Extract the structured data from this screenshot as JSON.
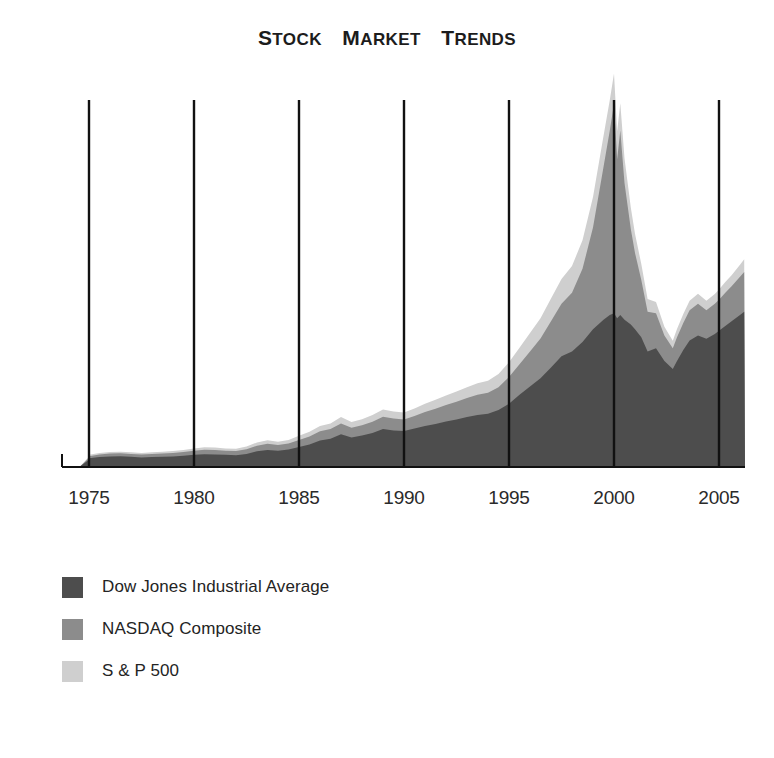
{
  "title": {
    "full": "STOCK MARKET TRENDS",
    "words": [
      {
        "cap": "S",
        "rest": "TOCK"
      },
      {
        "cap": "M",
        "rest": "ARKET"
      },
      {
        "cap": "T",
        "rest": "RENDS"
      }
    ]
  },
  "colors": {
    "dow": "#4d4d4d",
    "nasdaq": "#8c8c8c",
    "sp500": "#cfcfcf",
    "axis": "#111111",
    "text": "#1c1c1c",
    "background": "#ffffff"
  },
  "legend": {
    "position": "bottom-left",
    "items": [
      {
        "label": "Dow Jones Industrial Average",
        "color_key": "dow",
        "swatch_name": "dow-jones-swatch"
      },
      {
        "label": "NASDAQ Composite",
        "color_key": "nasdaq",
        "swatch_name": "nasdaq-swatch"
      },
      {
        "label": "S & P 500",
        "color_key": "sp500",
        "swatch_name": "sp500-swatch"
      }
    ]
  },
  "chart_data": {
    "type": "area",
    "stacked": true,
    "title": "Stock Market Trends",
    "xlabel": "",
    "ylabel": "",
    "grid": "vertical-only",
    "legend_position": "bottom-left",
    "xlim": [
      1974.0,
      2006.3
    ],
    "ylim": [
      0,
      100
    ],
    "axis_ticks": [
      "1975",
      "1980",
      "1985",
      "1990",
      "1995",
      "2000",
      "2005"
    ],
    "tick_values": [
      1975,
      1980,
      1985,
      1990,
      1995,
      2000,
      2005
    ],
    "note": "Values are relative index levels read off the plotted area heights (arbitrary units, 0-100 scale). Series are drawn stacked: Dow Jones at bottom, NASDAQ Composite above it, S & P 500 on top.",
    "x": [
      1974.6,
      1975.0,
      1975.5,
      1976.0,
      1976.5,
      1977.0,
      1977.5,
      1978.0,
      1978.5,
      1979.0,
      1979.5,
      1980.0,
      1980.5,
      1981.0,
      1981.5,
      1982.0,
      1982.5,
      1983.0,
      1983.5,
      1984.0,
      1984.5,
      1985.0,
      1985.5,
      1986.0,
      1986.5,
      1987.0,
      1987.5,
      1988.0,
      1988.5,
      1989.0,
      1989.5,
      1990.0,
      1990.5,
      1991.0,
      1991.5,
      1992.0,
      1992.5,
      1993.0,
      1993.5,
      1994.0,
      1994.5,
      1995.0,
      1995.5,
      1996.0,
      1996.5,
      1997.0,
      1997.5,
      1998.0,
      1998.5,
      1999.0,
      1999.5,
      1999.8,
      2000.0,
      2000.15,
      2000.3,
      2000.5,
      2000.8,
      2001.0,
      2001.3,
      2001.6,
      2002.0,
      2002.4,
      2002.8,
      2003.0,
      2003.3,
      2003.6,
      2004.0,
      2004.4,
      2004.8,
      2005.0,
      2005.3,
      2005.6,
      2006.0,
      2006.2
    ],
    "series": [
      {
        "name": "Dow Jones Industrial Average",
        "color": "#4d4d4d",
        "values": [
          2.0,
          2.4,
          2.8,
          3.0,
          3.1,
          2.9,
          2.7,
          2.8,
          2.9,
          3.0,
          3.2,
          3.5,
          3.7,
          3.6,
          3.5,
          3.4,
          3.8,
          4.6,
          5.0,
          4.8,
          5.2,
          6.0,
          6.8,
          8.0,
          8.6,
          10.0,
          9.0,
          9.6,
          10.4,
          11.6,
          11.2,
          11.0,
          11.8,
          12.6,
          13.2,
          14.0,
          14.6,
          15.4,
          16.0,
          16.4,
          17.6,
          19.6,
          22.4,
          25.0,
          27.6,
          31.0,
          34.5,
          36.0,
          39.0,
          43.0,
          46.0,
          47.5,
          48.0,
          46.5,
          47.5,
          46.0,
          44.5,
          43.0,
          40.5,
          36.0,
          37.0,
          33.0,
          30.5,
          33.0,
          36.5,
          39.5,
          41.0,
          40.0,
          41.5,
          42.5,
          44.0,
          45.5,
          47.5,
          48.5
        ]
      },
      {
        "name": "NASDAQ Composite",
        "color": "#8c8c8c",
        "values": [
          0.6,
          0.7,
          0.8,
          0.9,
          0.9,
          0.9,
          0.9,
          1.0,
          1.0,
          1.1,
          1.2,
          1.3,
          1.4,
          1.4,
          1.3,
          1.3,
          1.5,
          1.8,
          2.0,
          1.8,
          1.9,
          2.2,
          2.5,
          2.9,
          3.0,
          3.4,
          3.0,
          3.2,
          3.5,
          3.9,
          3.7,
          3.6,
          3.9,
          4.4,
          4.8,
          5.2,
          5.6,
          6.0,
          6.4,
          6.6,
          7.2,
          8.4,
          9.6,
          11.0,
          12.5,
          14.5,
          16.5,
          18.5,
          23.0,
          32.0,
          48.0,
          58.0,
          66.0,
          50.0,
          58.0,
          43.0,
          30.0,
          24.0,
          18.0,
          12.5,
          11.0,
          8.0,
          6.5,
          7.5,
          8.5,
          9.5,
          10.0,
          9.0,
          9.5,
          9.8,
          10.5,
          11.0,
          12.0,
          12.5
        ]
      },
      {
        "name": "S & P 500",
        "color": "#cfcfcf",
        "values": [
          0.4,
          0.4,
          0.5,
          0.5,
          0.5,
          0.5,
          0.5,
          0.5,
          0.6,
          0.6,
          0.6,
          0.7,
          0.8,
          0.8,
          0.7,
          0.7,
          0.8,
          1.0,
          1.1,
          1.0,
          1.1,
          1.3,
          1.5,
          1.7,
          1.8,
          2.0,
          1.8,
          1.9,
          2.1,
          2.3,
          2.2,
          2.2,
          2.4,
          2.6,
          2.8,
          3.0,
          3.2,
          3.4,
          3.6,
          3.8,
          4.1,
          4.6,
          5.2,
          5.8,
          6.4,
          7.2,
          7.8,
          8.4,
          9.0,
          9.6,
          9.8,
          9.6,
          9.4,
          8.8,
          8.6,
          7.8,
          6.8,
          6.0,
          5.0,
          4.0,
          3.6,
          2.8,
          2.4,
          2.6,
          2.8,
          3.0,
          3.2,
          3.0,
          3.1,
          3.2,
          3.4,
          3.5,
          3.8,
          4.0
        ]
      }
    ]
  },
  "axis": {
    "gridline_years": [
      1975,
      1980,
      1985,
      1990,
      1995,
      2000,
      2005
    ],
    "baseline_label": "x-axis-baseline"
  }
}
